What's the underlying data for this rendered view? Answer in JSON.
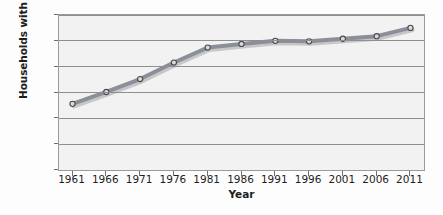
{
  "chart_data": {
    "type": "line",
    "title": "",
    "xlabel": "Year",
    "ylabel": "Households with one person (%)",
    "categories": [
      "1961",
      "1966",
      "1971",
      "1976",
      "1981",
      "1986",
      "1991",
      "1996",
      "2001",
      "2006",
      "2011"
    ],
    "x": [
      1961,
      1966,
      1971,
      1976,
      1981,
      1986,
      1991,
      1996,
      2001,
      2006,
      2011
    ],
    "values": [
      12.8,
      15.1,
      17.6,
      20.8,
      23.7,
      24.4,
      25.0,
      24.9,
      25.4,
      25.9,
      27.5
    ],
    "series": [
      {
        "name": "Households with one person",
        "values": [
          12.8,
          15.1,
          17.6,
          20.8,
          23.7,
          24.4,
          25.0,
          24.9,
          25.4,
          25.9,
          27.5
        ]
      }
    ],
    "ylim": [
      0,
      30
    ],
    "xlim": [
      1959,
      2013
    ],
    "yticks": [
      0,
      5,
      10,
      15,
      20,
      25,
      30
    ],
    "ytick_labels": [
      "0",
      "5",
      "10",
      "15",
      "20",
      "25",
      "30"
    ],
    "xticks": [
      1961,
      1966,
      1971,
      1976,
      1981,
      1986,
      1991,
      1996,
      2001,
      2006,
      2011
    ],
    "xtick_labels": [
      "1961",
      "1966",
      "1971",
      "1976",
      "1981",
      "1986",
      "1991",
      "1996",
      "2001",
      "2006",
      "2011"
    ],
    "grid": "horizontal",
    "legend": "none",
    "line_color": "#8a8f99",
    "marker": "open-circle",
    "marker_edge_color": "#4a4a4a",
    "marker_face_color": "#d9d9d9",
    "plot_background": "#f2f2f2",
    "page_background": "#fdfdfd",
    "axis_color": "#9b9b9b",
    "gridline_color": "#8f8f8f",
    "text_color": "#1d1d1d"
  }
}
